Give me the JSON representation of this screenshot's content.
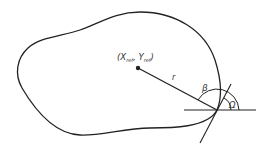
{
  "diagram": {
    "reference_point_label": {
      "open": "(",
      "x": "X",
      "x_sub": "ref",
      "sep": ", ",
      "y": "Y",
      "y_sub": "ref",
      "close": ")"
    },
    "radius_label": "r",
    "beta_label": "β",
    "omega_label": "Ω",
    "colors": {
      "stroke": "#222222",
      "text": "#333333"
    }
  }
}
